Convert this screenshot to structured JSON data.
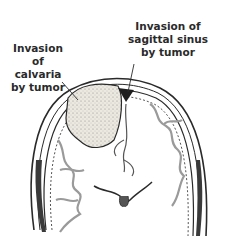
{
  "figure": {
    "labels": [
      {
        "id": "calvaria",
        "text_lines": [
          "Invasion of",
          "calvaria",
          "by tumor"
        ]
      },
      {
        "id": "sagittal_sinus",
        "text_lines": [
          "Invasion of",
          "sagittal sinus",
          "by tumor"
        ]
      }
    ]
  },
  "colors": {
    "background": "#ffffff",
    "ink": "#2a2a2a",
    "tumor_fill": "#e9e6de",
    "cortex_shade": "#b9b9b9"
  }
}
